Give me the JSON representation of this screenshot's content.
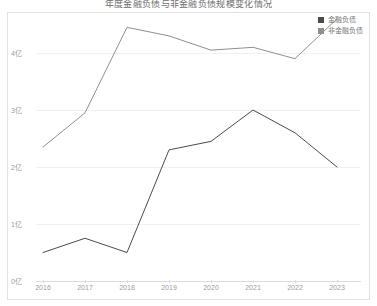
{
  "title": "年度金融负债与非金融负债规模变化情况",
  "legend": {
    "position": "top-right",
    "items": [
      {
        "label": "金融负债",
        "color": "#4b4b4b"
      },
      {
        "label": "非金融负债",
        "color": "#8f8f8f"
      }
    ]
  },
  "axes": {
    "y_ticks": [
      "0亿",
      "1亿",
      "2亿",
      "3亿",
      "4亿"
    ],
    "x_ticks": [
      "2016",
      "2017",
      "2018",
      "2019",
      "2020",
      "2021",
      "2022",
      "2023"
    ]
  },
  "chart_data": {
    "type": "line",
    "title": "年度金融负债与非金融负债规模变化情况",
    "xlabel": "",
    "ylabel": "",
    "unit": "亿",
    "categories": [
      "2016",
      "2017",
      "2018",
      "2019",
      "2020",
      "2021",
      "2022",
      "2023"
    ],
    "ylim": [
      0,
      4.6
    ],
    "y_tick_values": [
      0,
      1,
      2,
      3,
      4
    ],
    "y_tick_labels": [
      "0亿",
      "1亿",
      "2亿",
      "3亿",
      "4亿"
    ],
    "grid": true,
    "legend_position": "top-right",
    "series": [
      {
        "name": "金融负债",
        "color": "#4b4b4b",
        "values": [
          0.5,
          0.75,
          0.5,
          2.3,
          2.45,
          3.0,
          2.6,
          2.0
        ]
      },
      {
        "name": "非金融负债",
        "color": "#8f8f8f",
        "values": [
          2.35,
          2.95,
          4.45,
          4.3,
          4.05,
          4.1,
          3.9,
          4.6
        ]
      }
    ]
  }
}
